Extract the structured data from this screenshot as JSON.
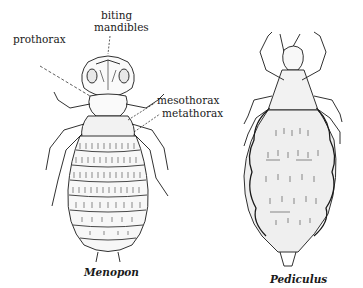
{
  "figure": {
    "specimens": [
      {
        "name": "Menopon",
        "labels": {
          "biting_mandibles_line1": "biting",
          "biting_mandibles_line2": "mandibles",
          "prothorax": "prothorax",
          "mesothorax": "mesothorax",
          "metathorax": "metathorax"
        }
      },
      {
        "name": "Pediculus"
      }
    ]
  },
  "colors": {
    "ink": "#1a1a1a",
    "background": "#ffffff"
  }
}
